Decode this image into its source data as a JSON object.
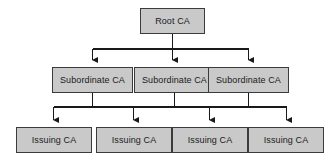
{
  "diagram": {
    "type": "tree",
    "orientation": "top-down",
    "colors": {
      "node_fill": "#c9c9c9",
      "node_border": "#3b3b3b",
      "connector": "#1a1a1a",
      "text": "#1a1a1a",
      "background": "#ffffff"
    },
    "tiers": [
      {
        "name": "root-tier",
        "level": 1,
        "nodes": [
          {
            "id": "root",
            "label": "Root CA"
          }
        ]
      },
      {
        "name": "subordinate-tier",
        "level": 2,
        "nodes": [
          {
            "id": "sub-0",
            "label": "Subordinate CA"
          },
          {
            "id": "sub-1",
            "label": "Subordinate CA"
          },
          {
            "id": "sub-2",
            "label": "Subordinate CA"
          }
        ]
      },
      {
        "name": "issuing-tier",
        "level": 3,
        "nodes": [
          {
            "id": "iss-0",
            "label": "Issuing CA"
          },
          {
            "id": "iss-1",
            "label": "Issuing CA"
          },
          {
            "id": "iss-2",
            "label": "Issuing CA"
          },
          {
            "id": "iss-3",
            "label": "Issuing CA"
          }
        ]
      }
    ],
    "connectors": {
      "style": "orthogonal-with-arrowheads",
      "bus_level_1_y": 49,
      "bus_level_2_y": 107,
      "edges": [
        {
          "from": "root",
          "to": "sub-0"
        },
        {
          "from": "root",
          "to": "sub-1"
        },
        {
          "from": "root",
          "to": "sub-2"
        },
        {
          "from": "sub-0",
          "to": "iss-0"
        },
        {
          "from": "sub-0",
          "to": "iss-1"
        },
        {
          "from": "sub-1",
          "to": "iss-2"
        },
        {
          "from": "sub-2",
          "to": "iss-3"
        }
      ]
    }
  }
}
